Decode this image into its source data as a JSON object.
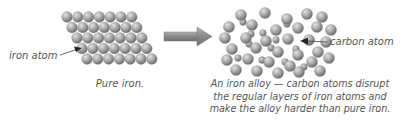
{
  "labels": {
    "iron_atom": "iron atom",
    "carbon_atom": "carbon atom"
  },
  "captions": {
    "pure_iron": "Pure iron.",
    "alloy": "An iron alloy — carbon atoms disrupt the regular layers of iron atoms and make the alloy harder than pure iron."
  },
  "colors": {
    "atom_light": "#d0d0d0",
    "atom_dark": "#7a7a7a",
    "arrow": "#8a8a8a",
    "text": "#555555"
  }
}
